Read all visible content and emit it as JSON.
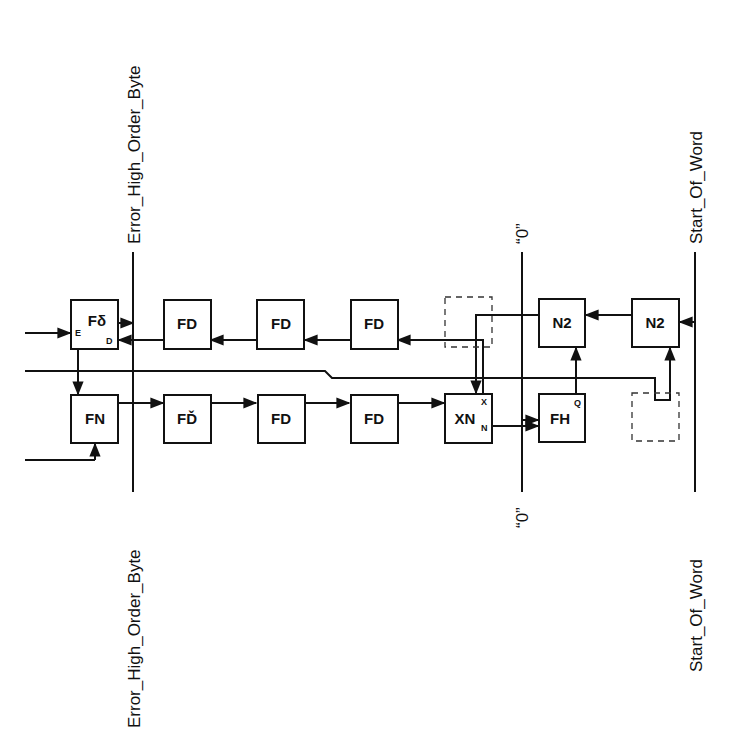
{
  "diagram": {
    "bus_labels": {
      "left_top": "Error_High_Order_Byte",
      "left_bottom": "Error_High_Order_Byte",
      "middle_top": "“0”",
      "middle_bottom": "“0”",
      "right_top": "Start_Of_Word",
      "right_bottom": "Start_Of_Word"
    },
    "blocks": {
      "f_top": "Fδ",
      "f_top_port_e": "E",
      "f_top_port_d": "D",
      "fn": "FN",
      "top_fd_1": "FD",
      "top_fd_2": "FD",
      "top_fd_3": "FD",
      "bottom_fd_1": "FĎ",
      "bottom_fd_2": "FD",
      "bottom_fd_3": "FD",
      "xn": "XN",
      "xn_sub": "N",
      "xn_port_x": "X",
      "n2_left": "N2",
      "n2_right": "N2",
      "fh": "FH",
      "fh_port_q": "Q"
    }
  }
}
